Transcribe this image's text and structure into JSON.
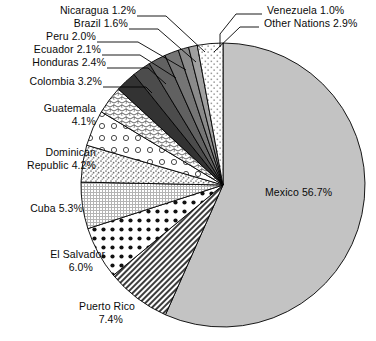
{
  "chart_data": {
    "type": "pie",
    "title": "",
    "subtitle": "",
    "xlabel": "",
    "ylabel": "",
    "legend_position": "callout-labels",
    "grid": false,
    "start_angle_deg": 0,
    "direction": "clockwise",
    "units": "percent",
    "categories": [
      "Mexico",
      "Puerto Rico",
      "El Salvador",
      "Cuba",
      "Dominican Republic",
      "Guatemala",
      "Colombia",
      "Honduras",
      "Ecuador",
      "Peru",
      "Brazil",
      "Nicaragua",
      "Venezuela",
      "Other Nations"
    ],
    "values": [
      56.7,
      7.4,
      6.0,
      5.3,
      4.2,
      4.1,
      3.2,
      2.4,
      2.1,
      2.0,
      1.6,
      1.2,
      1.0,
      2.9
    ],
    "slices": [
      {
        "name": "Mexico",
        "value": 56.7,
        "label": "Mexico 56.7%",
        "fill": "#c3c3c3",
        "pattern": "solid-gray",
        "label_placement": "inside"
      },
      {
        "name": "Puerto Rico",
        "value": 7.4,
        "label": "Puerto Rico",
        "value_label": "7.4%",
        "fill": "#ffffff",
        "pattern": "dense-diagonal",
        "label_placement": "outside"
      },
      {
        "name": "El Salvador",
        "value": 6.0,
        "label": "El Salvador",
        "value_label": "6.0%",
        "fill": "#ffffff",
        "pattern": "bold-dots",
        "label_placement": "outside"
      },
      {
        "name": "Cuba",
        "value": 5.3,
        "label": "Cuba 5.3%",
        "fill": "#ffffff",
        "pattern": "fine-grid",
        "label_placement": "outside"
      },
      {
        "name": "Dominican Republic",
        "value": 4.2,
        "label": "Dominican",
        "value_label": "Republic 4.2%",
        "fill": "#ffffff",
        "pattern": "stipple",
        "label_placement": "outside"
      },
      {
        "name": "Guatemala",
        "value": 4.1,
        "label": "Guatemala",
        "value_label": "4.1%",
        "fill": "#ffffff",
        "pattern": "open-circles",
        "label_placement": "outside"
      },
      {
        "name": "Colombia",
        "value": 3.2,
        "label": "Colombia 3.2%",
        "fill": "#ffffff",
        "pattern": "squiggle",
        "label_placement": "outside"
      },
      {
        "name": "Honduras",
        "value": 2.4,
        "label": "Honduras 2.4%",
        "fill": "#333333",
        "pattern": "solid-dark",
        "label_placement": "outside"
      },
      {
        "name": "Ecuador",
        "value": 2.1,
        "label": "Ecuador 2.1%",
        "fill": "#4c4c4c",
        "pattern": "solid-dark",
        "label_placement": "outside"
      },
      {
        "name": "Peru",
        "value": 2.0,
        "label": "Peru 2.0%",
        "fill": "#616161",
        "pattern": "solid-dark",
        "label_placement": "outside"
      },
      {
        "name": "Brazil",
        "value": 1.6,
        "label": "Brazil 1.6%",
        "fill": "#757575",
        "pattern": "solid-dark",
        "label_placement": "outside"
      },
      {
        "name": "Nicaragua",
        "value": 1.2,
        "label": "Nicaragua 1.2%",
        "fill": "#8a8a8a",
        "pattern": "solid-dark",
        "label_placement": "outside"
      },
      {
        "name": "Venezuela",
        "value": 1.0,
        "label": "Venezuela 1.0%",
        "fill": "#a0a0a0",
        "pattern": "solid-dark",
        "label_placement": "outside"
      },
      {
        "name": "Other Nations",
        "value": 2.9,
        "label": "Other Nations 2.9%",
        "fill": "#ffffff",
        "pattern": "light-stipple",
        "label_placement": "outside"
      }
    ],
    "colors": {
      "mexico_gray": "#c3c3c3",
      "outline": "#000000",
      "text": "#0a0a0a",
      "background": "#ffffff"
    }
  },
  "labels": {
    "nicaragua": "Nicaragua 1.2%",
    "brazil": "Brazil 1.6%",
    "peru": "Peru 2.0%",
    "ecuador": "Ecuador 2.1%",
    "honduras": "Honduras 2.4%",
    "colombia": "Colombia 3.2%",
    "guatemala_l1": "Guatemala",
    "guatemala_l2": "4.1%",
    "dominican_l1": "Dominican",
    "dominican_l2": "Republic 4.2%",
    "cuba": "Cuba 5.3%",
    "el_salvador_l1": "El Salvador",
    "el_salvador_l2": "6.0%",
    "puerto_rico_l1": "Puerto Rico",
    "puerto_rico_l2": "7.4%",
    "venezuela": "Venezuela 1.0%",
    "other_nations": "Other Nations 2.9%",
    "mexico": "Mexico 56.7%"
  }
}
